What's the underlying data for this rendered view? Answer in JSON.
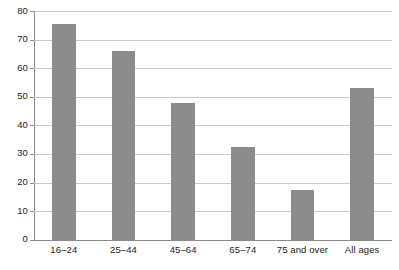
{
  "chart_data": {
    "type": "bar",
    "title": "",
    "subtitle": "",
    "xlabel": "",
    "ylabel": "",
    "categories": [
      "16–24",
      "25–44",
      "45–64",
      "65–74",
      "75 and over",
      "All ages"
    ],
    "values": [
      75.5,
      66,
      48,
      32.5,
      17.5,
      53
    ],
    "series": [
      {
        "name": "",
        "values": [
          75.5,
          66,
          48,
          32.5,
          17.5,
          53
        ]
      }
    ],
    "ylim": [
      0,
      80
    ],
    "y_ticks": [
      0,
      10,
      20,
      30,
      40,
      50,
      60,
      70,
      80
    ],
    "y_tick_labels": [
      "0",
      "10",
      "20",
      "30",
      "40",
      "50",
      "60",
      "70",
      "80"
    ],
    "grid": true,
    "grid_axis": "y",
    "legend": false,
    "legend_position": "none",
    "bar_color": "#8c8c8c",
    "gridline_color": "#c9c9c9",
    "axis_color": "#8a8a8a",
    "background_color": "#ffffff",
    "annotations": []
  },
  "footer": {
    "clipped_caption": "· ·· · ·· · ··· · ·· ·· · ··"
  }
}
